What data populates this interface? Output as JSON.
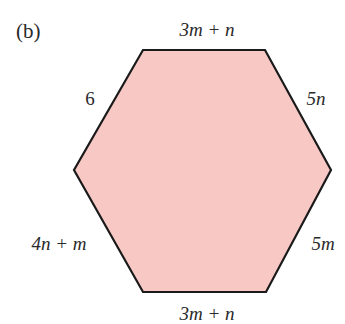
{
  "figure": {
    "part_label": "(b)",
    "shape": "hexagon",
    "colors": {
      "fill": "#f7c8c4",
      "stroke": "#1a1a1a",
      "text": "#2a2a2a"
    },
    "vertices": [
      [
        143,
        50
      ],
      [
        265,
        50
      ],
      [
        331,
        170
      ],
      [
        266,
        292
      ],
      [
        143,
        292
      ],
      [
        74,
        170
      ]
    ],
    "sides": {
      "top": "3m + n",
      "top_right": "5n",
      "bottom_right": "5m",
      "bottom": "3m + n",
      "bottom_left": "4n + m",
      "top_left": "6"
    }
  }
}
